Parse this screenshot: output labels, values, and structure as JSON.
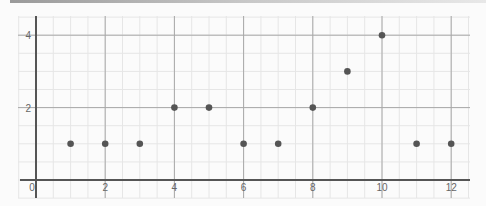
{
  "chart_data": {
    "type": "scatter",
    "title": "",
    "xlabel": "",
    "ylabel": "",
    "x_ticks": [
      "0",
      "2",
      "4",
      "6",
      "8",
      "10",
      "12"
    ],
    "y_ticks": [
      "2",
      "4"
    ],
    "xlim": [
      -0.5,
      12.5
    ],
    "ylim": [
      -0.3,
      4.3
    ],
    "grid": true,
    "minor_grid": true,
    "legend": null,
    "points": [
      {
        "x": 1,
        "y": 1
      },
      {
        "x": 2,
        "y": 1
      },
      {
        "x": 3,
        "y": 1
      },
      {
        "x": 4,
        "y": 2
      },
      {
        "x": 5,
        "y": 2
      },
      {
        "x": 6,
        "y": 1
      },
      {
        "x": 7,
        "y": 1
      },
      {
        "x": 8,
        "y": 2
      },
      {
        "x": 9,
        "y": 3
      },
      {
        "x": 10,
        "y": 4
      },
      {
        "x": 11,
        "y": 1
      },
      {
        "x": 12,
        "y": 1
      }
    ],
    "point_color": "#555555"
  }
}
